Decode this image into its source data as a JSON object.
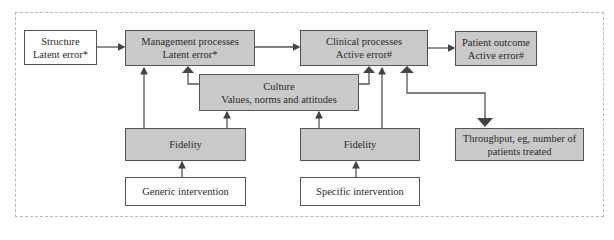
{
  "diagram": {
    "nodes": {
      "structure": {
        "line1": "Structure",
        "line2": "Latent error*"
      },
      "management": {
        "line1": "Management processes",
        "line2": "Latent error*"
      },
      "clinical": {
        "line1": "Clinical processes",
        "line2": "Active error#"
      },
      "outcome": {
        "line1": "Patient outcome",
        "line2": "Active error#"
      },
      "culture": {
        "line1": "Culture",
        "line2": "Values, norms and attitudes"
      },
      "fidelity_left": {
        "line1": "Fidelity"
      },
      "fidelity_right": {
        "line1": "Fidelity"
      },
      "throughput": {
        "line1": "Throughput, eg, number of",
        "line2": "patients treated"
      },
      "generic": {
        "line1": "Generic intervention"
      },
      "specific": {
        "line1": "Specific intervention"
      }
    },
    "edges": [
      {
        "from": "structure",
        "to": "management"
      },
      {
        "from": "management",
        "to": "clinical"
      },
      {
        "from": "clinical",
        "to": "outcome"
      },
      {
        "from": "culture",
        "to": "management"
      },
      {
        "from": "culture",
        "to": "clinical"
      },
      {
        "from": "fidelity_left",
        "to": "management"
      },
      {
        "from": "fidelity_left",
        "to": "culture"
      },
      {
        "from": "fidelity_right",
        "to": "culture"
      },
      {
        "from": "fidelity_right",
        "to": "clinical"
      },
      {
        "from": "generic",
        "to": "fidelity_left"
      },
      {
        "from": "specific",
        "to": "fidelity_right"
      },
      {
        "from": "throughput",
        "to": "clinical",
        "bidirectional": true
      }
    ],
    "colors": {
      "shaded": "#c9c9c9",
      "border": "#555555",
      "line": "#555555"
    }
  }
}
